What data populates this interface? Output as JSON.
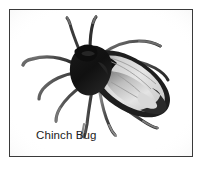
{
  "figure": {
    "caption": "Chinch Bug",
    "media_type": "grayscale-photo-illustration",
    "frame": {
      "border_color": "#3a3a3a",
      "background_color": "#ffffff",
      "page_background": "#ffffff"
    },
    "palette": {
      "body_black": "#141414",
      "body_dark": "#262626",
      "wing_membrane_light": "#e2e2e2",
      "wing_membrane_mid": "#c4c4c4",
      "wing_shade_dark": "#6f6f6f",
      "leg_gray": "#595959",
      "leg_light_gray": "#8c8c8c",
      "caption_text": "#1c1c1c"
    },
    "anatomy": [
      {
        "part": "antenna-left",
        "shade": "#3d3d3d"
      },
      {
        "part": "antenna-right",
        "shade": "#3d3d3d"
      },
      {
        "part": "head",
        "shade": "#141414"
      },
      {
        "part": "thorax",
        "shade": "#141414"
      },
      {
        "part": "forewing-left",
        "shade": "#d9d9d9"
      },
      {
        "part": "forewing-right",
        "shade": "#cfcfcf"
      },
      {
        "part": "wing-margin",
        "shade": "#1f1f1f"
      },
      {
        "part": "legs",
        "count": 6,
        "shade": "#595959"
      }
    ]
  }
}
